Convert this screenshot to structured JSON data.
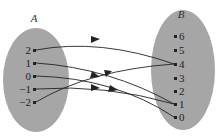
{
  "diagram": {
    "type": "mapping-diagram",
    "set_a": {
      "name": "A",
      "elements": [
        "2",
        "1",
        "0",
        "−1",
        "−2"
      ],
      "color": "#a6a6a6"
    },
    "set_b": {
      "name": "B",
      "elements": [
        "6",
        "5",
        "4",
        "3",
        "2",
        "1",
        "0"
      ],
      "color": "#a6a6a6"
    },
    "mappings": [
      {
        "from": "2",
        "to": "4",
        "confidence": "observed"
      },
      {
        "from": "1",
        "to": "1",
        "confidence": "observed"
      },
      {
        "from": "0",
        "to": "0",
        "confidence": "inferred"
      },
      {
        "from": "−1",
        "to": "1",
        "confidence": "observed"
      },
      {
        "from": "−2",
        "to": "4",
        "confidence": "observed"
      }
    ],
    "note": "0 -> 0 endpoint not clearly resolved in source; inferred from x^2 pattern"
  }
}
